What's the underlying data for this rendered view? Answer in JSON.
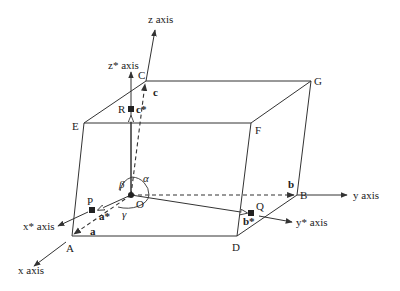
{
  "diagram": {
    "vertices": {
      "O": "O",
      "A": "A",
      "B": "B",
      "C": "C",
      "D": "D",
      "E": "E",
      "F": "F",
      "G": "G"
    },
    "points": {
      "P": "P",
      "Q": "Q",
      "R": "R"
    },
    "axes": {
      "x": "x axis",
      "y": "y axis",
      "z": "z axis",
      "x_star": "x* axis",
      "y_star": "y* axis",
      "z_star": "z* axis"
    },
    "vectors": {
      "a": "a",
      "b": "b",
      "c": "c",
      "a_star": "a*",
      "b_star": "b*",
      "c_star": "c*"
    },
    "angles": {
      "alpha": "α",
      "beta": "β",
      "gamma": "γ"
    },
    "colors": {
      "line": "#333333",
      "text": "#222222",
      "background": "#ffffff"
    }
  }
}
